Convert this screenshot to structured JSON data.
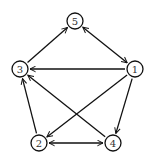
{
  "graph": {
    "type": "directed-graph",
    "node_radius": 8,
    "nodes": [
      {
        "id": "1",
        "label": "1",
        "x": 135,
        "y": 69
      },
      {
        "id": "2",
        "label": "2",
        "x": 39,
        "y": 143
      },
      {
        "id": "3",
        "label": "3",
        "x": 20,
        "y": 69
      },
      {
        "id": "4",
        "label": "4",
        "x": 113,
        "y": 143
      },
      {
        "id": "5",
        "label": "5",
        "x": 75,
        "y": 21
      }
    ],
    "edges": [
      {
        "from": "3",
        "to": "5",
        "bidirectional": false
      },
      {
        "from": "5",
        "to": "1",
        "bidirectional": true
      },
      {
        "from": "1",
        "to": "3",
        "bidirectional": false
      },
      {
        "from": "1",
        "to": "2",
        "bidirectional": false
      },
      {
        "from": "1",
        "to": "4",
        "bidirectional": false
      },
      {
        "from": "2",
        "to": "3",
        "bidirectional": false
      },
      {
        "from": "4",
        "to": "3",
        "bidirectional": false
      },
      {
        "from": "2",
        "to": "4",
        "bidirectional": true
      }
    ]
  }
}
